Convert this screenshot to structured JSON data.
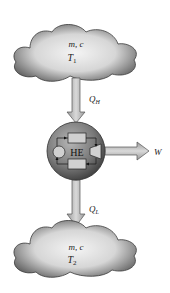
{
  "diagram": {
    "top_reservoir": {
      "line1": "m, c",
      "line2_main": "T",
      "line2_sub": "1"
    },
    "bottom_reservoir": {
      "line1": "m, c",
      "line2_main": "T",
      "line2_sub": "2"
    },
    "engine": {
      "label": "HE"
    },
    "heat_in": {
      "main": "Q",
      "sub": "H"
    },
    "heat_out": {
      "main": "Q",
      "sub": "L"
    },
    "work": {
      "label": "W"
    },
    "colors": {
      "cloud_edge": "#3a3a3a",
      "cloud_light": "#f2f2f2",
      "cloud_dark": "#6a6a6a",
      "arrow_fill": "#bdbdbd",
      "arrow_stroke": "#555555",
      "engine_dark": "#4a4a4a",
      "engine_light": "#a8a8a8"
    }
  }
}
